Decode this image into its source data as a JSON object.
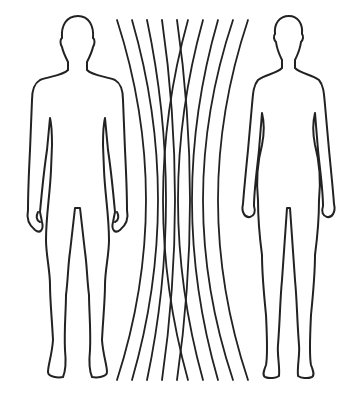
{
  "figure": {
    "description": "Outline illustration of a male and a female human figure with curved field lines between them",
    "left_figure": "male-silhouette",
    "right_figure": "female-silhouette",
    "field_line_count": 10,
    "colors": {
      "stroke": "#222222",
      "background": "#ffffff"
    }
  }
}
